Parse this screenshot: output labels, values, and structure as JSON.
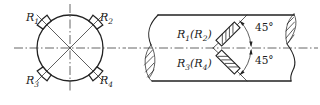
{
  "colors": {
    "line": "#222222",
    "background": "#ffffff"
  },
  "cross_section": {
    "labels": [
      {
        "base": "R",
        "sub": "1"
      },
      {
        "base": "R",
        "sub": "2"
      },
      {
        "base": "R",
        "sub": "3"
      },
      {
        "base": "R",
        "sub": "4"
      }
    ]
  },
  "side_view": {
    "upper_label": {
      "base": "R",
      "sub1": "1",
      "mid": "(R",
      "sub2": "2",
      "close": ")"
    },
    "lower_label": {
      "base": "R",
      "sub1": "3",
      "mid": "(R",
      "sub2": "4",
      "close": ")"
    },
    "angle_upper": "45°",
    "angle_lower": "45°"
  }
}
